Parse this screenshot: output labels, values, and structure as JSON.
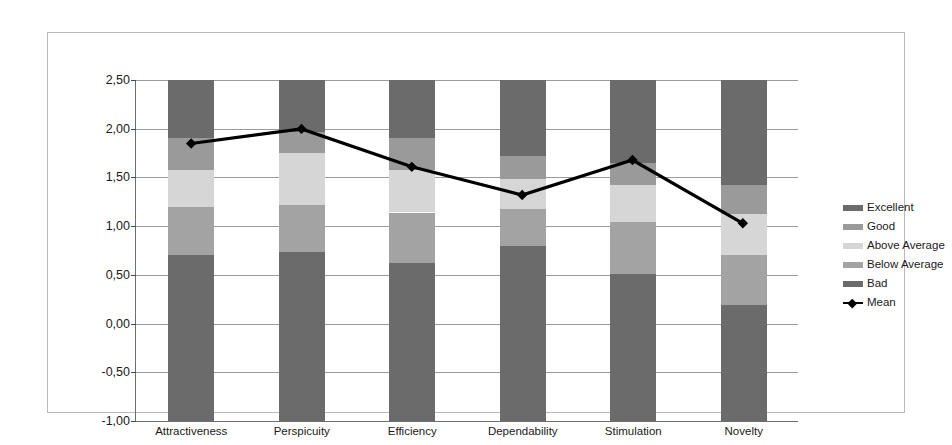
{
  "chart_data": {
    "type": "bar",
    "title": "",
    "subtitle": "",
    "xlabel": "",
    "ylabel": "",
    "grid": true,
    "legend_position": "right",
    "ylim": [
      -1.0,
      2.5
    ],
    "ytick_labels": [
      "2,50",
      "2,00",
      "1,50",
      "1,00",
      "0,50",
      "0,00",
      "-0,50",
      "-1,00"
    ],
    "ytick_values": [
      2.5,
      2.0,
      1.5,
      1.0,
      0.5,
      0.0,
      -0.5,
      -1.0
    ],
    "categories": [
      "Attractiveness",
      "Perspicuity",
      "Efficiency",
      "Dependability",
      "Stimulation",
      "Novelty"
    ],
    "stack_order_bottom_to_top": [
      "Bad",
      "Below Average",
      "Above Average",
      "Good",
      "Excellent"
    ],
    "band_boundaries": {
      "Attractiveness": [
        -1.0,
        0.7,
        1.2,
        1.58,
        1.9,
        2.5
      ],
      "Perspicuity": [
        -1.0,
        0.73,
        1.22,
        1.75,
        1.97,
        2.5
      ],
      "Efficiency": [
        -1.0,
        0.62,
        1.14,
        1.58,
        1.9,
        2.5
      ],
      "Dependability": [
        -1.0,
        0.8,
        1.18,
        1.48,
        1.72,
        2.5
      ],
      "Stimulation": [
        -1.0,
        0.51,
        1.04,
        1.42,
        1.65,
        2.5
      ],
      "Novelty": [
        -1.0,
        0.19,
        0.7,
        1.12,
        1.42,
        2.5
      ]
    },
    "series": [
      {
        "name": "Bad",
        "color": "#6b6b6b",
        "values": [
          1.7,
          1.73,
          1.62,
          1.8,
          1.51,
          1.19
        ]
      },
      {
        "name": "Below Average",
        "color": "#a3a3a3",
        "values": [
          0.5,
          0.49,
          0.52,
          0.38,
          0.53,
          0.51
        ]
      },
      {
        "name": "Above Average",
        "color": "#d6d6d6",
        "values": [
          0.38,
          0.53,
          0.44,
          0.3,
          0.38,
          0.42
        ]
      },
      {
        "name": "Good",
        "color": "#9a9a9a",
        "values": [
          0.32,
          0.22,
          0.32,
          0.24,
          0.23,
          0.3
        ]
      },
      {
        "name": "Excellent",
        "color": "#6b6b6b",
        "values": [
          0.6,
          0.53,
          0.6,
          0.78,
          0.85,
          1.08
        ]
      }
    ],
    "mean_line": {
      "name": "Mean",
      "color": "#000000",
      "marker": "diamond",
      "values": [
        1.85,
        2.0,
        1.61,
        1.32,
        1.68,
        1.03
      ]
    }
  },
  "legend": {
    "items": [
      {
        "label": "Excellent",
        "color": "#6b6b6b",
        "type": "swatch"
      },
      {
        "label": "Good",
        "color": "#9a9a9a",
        "type": "swatch"
      },
      {
        "label": "Above Average",
        "color": "#d6d6d6",
        "type": "swatch"
      },
      {
        "label": "Below Average",
        "color": "#a3a3a3",
        "type": "swatch"
      },
      {
        "label": "Bad",
        "color": "#6b6b6b",
        "type": "swatch"
      },
      {
        "label": "Mean",
        "color": "#000000",
        "type": "line-marker"
      }
    ]
  },
  "colors": {
    "frame_border": "#b9b9b9",
    "gridline": "#9b9b9b",
    "axis": "#6e6e6e",
    "text": "#1a1a1a",
    "background": "#ffffff"
  }
}
